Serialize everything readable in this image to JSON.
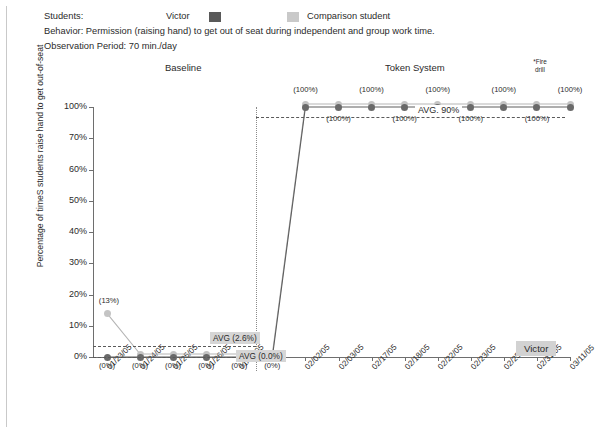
{
  "header": {
    "students_label": "Students:",
    "victor_legend": "Victor",
    "comparison_legend": "Comparison student",
    "behavior": "Behavior: Permission (raising hand) to get out of seat during independent and group work time.",
    "observation": "Observation Period: 70 min./day",
    "victor_color": "#595959",
    "comparison_color": "#c9c9c9"
  },
  "annotations": {
    "phase_baseline": "Baseline",
    "phase_token": "Token System",
    "fire_drill": "*Fire\ndrill",
    "fire_drill_line1": "*Fire",
    "fire_drill_line2": "drill",
    "avg_baseline_comparison": "AVG (2.6%)",
    "avg_baseline_victor": "AVG (0.0%)",
    "avg_token": "AVG. 90%",
    "victor_box": "Victor"
  },
  "chart_data": {
    "type": "line",
    "title": "",
    "xlabel": "",
    "ylabel": "Percentage of timeS students raise hand to get out-of-seat",
    "ytick_labels": [
      "0%",
      "10%",
      "20%",
      "30%",
      "40%",
      "50%",
      "60%",
      "70%",
      "100%"
    ],
    "ytick_values": [
      0,
      10,
      20,
      30,
      40,
      50,
      60,
      70,
      100
    ],
    "ylim": [
      0,
      100
    ],
    "grid": false,
    "legend_position": "top",
    "categories": [
      "01/23/05",
      "01/24/05",
      "01/25/05",
      "01/26/05",
      "01/27/05",
      "02/01/05",
      "02/02/05",
      "02/03/05",
      "02/17/05",
      "02/18/05",
      "02/22/05",
      "02/23/05",
      "02/25/05",
      "02/31/05",
      "03/11/05"
    ],
    "phase_change_after_index": 4,
    "series": [
      {
        "name": "Victor",
        "color": "#6a6a6a",
        "values": [
          0,
          0,
          0,
          0,
          0,
          0,
          100,
          100,
          100,
          100,
          100,
          100,
          100,
          100,
          100
        ],
        "labels": [
          "(0%)",
          "(0%)",
          "(0%)",
          "(0%)",
          "(0%)",
          "(0%)",
          "(100%)",
          "(100%)",
          "(100%)",
          "(100%)",
          "(100%)",
          "(100%)",
          "(100%)",
          "(100%)",
          "(100%)"
        ]
      },
      {
        "name": "Comparison student",
        "color": "#c4c4c4",
        "values": [
          13,
          0,
          0,
          0,
          0,
          0,
          100,
          100,
          100,
          100,
          100,
          100,
          100,
          100,
          100
        ],
        "labels": [
          "(13%)",
          "",
          "",
          "",
          "",
          "",
          "",
          "",
          "",
          "",
          "",
          "",
          "",
          "",
          ""
        ]
      }
    ],
    "reference_lines": [
      {
        "label": "AVG (2.6%)",
        "value": 2.6,
        "phase": "baseline",
        "series": "Comparison student"
      },
      {
        "label": "AVG (0.0%)",
        "value": 0.0,
        "phase": "baseline",
        "series": "Victor"
      },
      {
        "label": "AVG. 90%",
        "value": 90,
        "phase": "token",
        "series": "Victor"
      }
    ],
    "point_labels_top": [
      "(100%)",
      "(100%)",
      "(100%)",
      "(100%)",
      "(100%)"
    ],
    "point_labels_bottom": [
      "(100%)",
      "(100%)",
      "(100%)",
      "(100%)"
    ],
    "baseline_point_labels": [
      "(0%)",
      "(0%)",
      "(0%)",
      "(0%)",
      "(0%)",
      "(0%)"
    ]
  }
}
